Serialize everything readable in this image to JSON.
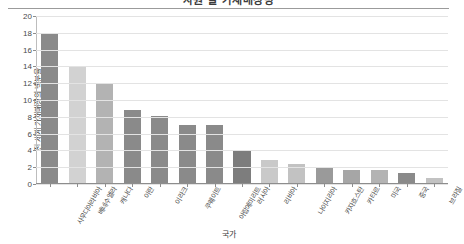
{
  "chart_data": {
    "type": "bar",
    "title": "자원 별 가채매장량",
    "xlabel": "국가",
    "ylabel": "전 세계 가채매장의 백분율",
    "ylim": [
      0,
      20
    ],
    "ytick_step": 2,
    "yticks": [
      "0",
      "2",
      "4",
      "6",
      "8",
      "10",
      "12",
      "14",
      "16",
      "18",
      "20"
    ],
    "grid": true,
    "legend": "none",
    "categories": [
      "사우디아라비아",
      "베네수엘라",
      "캐나다",
      "이란",
      "이라크",
      "쿠웨이트",
      "아랍에미리트",
      "러시아",
      "리비아",
      "나이지리아",
      "카자흐스탄",
      "카타르",
      "미국",
      "중국",
      "브라질"
    ],
    "values": [
      18.0,
      13.9,
      12.0,
      8.8,
      8.0,
      7.0,
      6.9,
      3.9,
      2.8,
      2.3,
      1.9,
      1.6,
      1.6,
      1.2,
      0.6
    ],
    "bar_colors": [
      "#8a8a8a",
      "#d2d2d2",
      "#b3b3b3",
      "#8a8a8a",
      "#8a8a8a",
      "#8a8a8a",
      "#8a8a8a",
      "#7d7d7d",
      "#c9c9c9",
      "#c2c2c2",
      "#9a9a9a",
      "#a6a6a6",
      "#b3b3b3",
      "#8a8a8a",
      "#c2c2c2"
    ],
    "axis_color": "#8d8d8d",
    "grid_color": "#e3e3e3",
    "background": "#ffffff"
  }
}
